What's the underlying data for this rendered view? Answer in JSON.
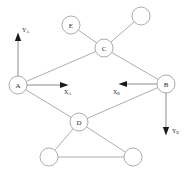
{
  "diagram": {
    "background_color": "#ffffff",
    "edge_color": "#8a8a8a",
    "node_fill": "#ffffff",
    "node_stroke": "#8a8a8a",
    "label_color": "#2b2b2b",
    "arrow_color": "#1a1a1a",
    "nodes": [
      {
        "id": "A",
        "label": "A",
        "cx": 18,
        "cy": 85,
        "r": 9
      },
      {
        "id": "B",
        "label": "B",
        "cx": 166,
        "cy": 84,
        "r": 9
      },
      {
        "id": "C",
        "label": "C",
        "cx": 104,
        "cy": 48,
        "r": 9
      },
      {
        "id": "D",
        "label": "D",
        "cx": 79,
        "cy": 122,
        "r": 9
      },
      {
        "id": "E",
        "label": "E",
        "cx": 71,
        "cy": 25,
        "r": 9
      },
      {
        "id": "N1",
        "label": "",
        "cx": 141,
        "cy": 16,
        "r": 9
      },
      {
        "id": "N2",
        "label": "",
        "cx": 49,
        "cy": 157,
        "r": 9
      },
      {
        "id": "N3",
        "label": "",
        "cx": 133,
        "cy": 157,
        "r": 9
      }
    ],
    "edges": [
      {
        "from": "A",
        "to": "C"
      },
      {
        "from": "C",
        "to": "B"
      },
      {
        "from": "A",
        "to": "D"
      },
      {
        "from": "D",
        "to": "B"
      },
      {
        "from": "E",
        "to": "C"
      },
      {
        "from": "C",
        "to": "N1"
      },
      {
        "from": "D",
        "to": "N2"
      },
      {
        "from": "D",
        "to": "N3"
      },
      {
        "from": "N2",
        "to": "N3"
      }
    ],
    "axes": [
      {
        "id": "ya",
        "frame": "A",
        "symbol": "Y",
        "subscript": "A",
        "direction": "up",
        "x1": 18,
        "y1": 76,
        "x2": 18,
        "y2": 40,
        "label_x": 22,
        "label_y": 30
      },
      {
        "id": "xa",
        "frame": "A",
        "symbol": "X",
        "subscript": "A",
        "direction": "right",
        "x1": 27,
        "y1": 85,
        "x2": 61,
        "y2": 85,
        "label_x": 64,
        "label_y": 92
      },
      {
        "id": "xb",
        "frame": "B",
        "symbol": "X",
        "subscript": "B",
        "direction": "left",
        "x1": 157,
        "y1": 84,
        "x2": 126,
        "y2": 84,
        "label_x": 113,
        "label_y": 92
      },
      {
        "id": "yb",
        "frame": "B",
        "symbol": "Y",
        "subscript": "B",
        "direction": "down",
        "x1": 166,
        "y1": 93,
        "x2": 166,
        "y2": 128,
        "label_x": 172,
        "label_y": 131
      }
    ]
  }
}
